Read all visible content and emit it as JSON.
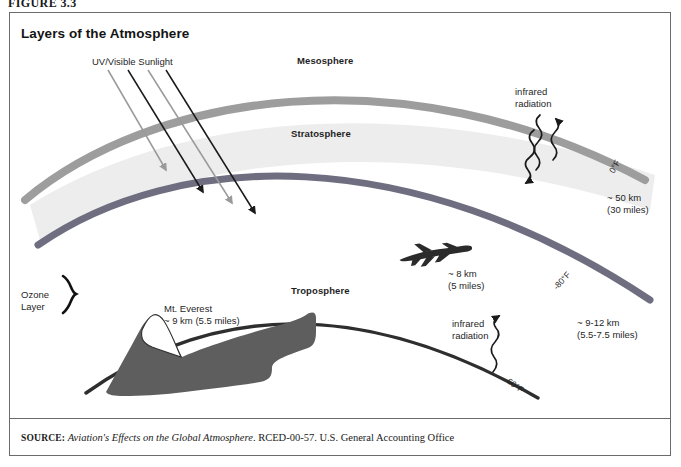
{
  "figure": {
    "number_label": "FIGURE 3.3",
    "title": "Layers of the Atmosphere",
    "frame_border_color": "#6b6b6b",
    "background_color": "#ffffff"
  },
  "source": {
    "label": "SOURCE:",
    "italic_part": "Aviation's Effects on the Global Atmosphere",
    "rest": ". RCED-00-57. U.S. General Accounting Office"
  },
  "layers": [
    {
      "name": "Mesosphere",
      "label_x": 297,
      "label_y": 55,
      "band_color": "#9a9a9a"
    },
    {
      "name": "Stratosphere",
      "label_x": 291,
      "label_y": 128,
      "band_color": "#7a7a8a"
    },
    {
      "name": "Troposphere",
      "label_x": 291,
      "label_y": 285,
      "band_color": "#2b2b2b"
    }
  ],
  "annotations": {
    "sunlight": {
      "label": "UV/Visible Sunlight",
      "label_x": 92,
      "label_y": 56,
      "ray_colors": [
        "#9a9a9a",
        "#1a1a1a",
        "#9a9a9a",
        "#1a1a1a"
      ]
    },
    "ozone": {
      "line1": "Ozone",
      "line2": "Layer",
      "label_x": 21,
      "label_y": 289
    },
    "everest": {
      "line1": "Mt. Everest",
      "line2": "~ 9 km (5.5 miles)",
      "label_x": 164,
      "label_y": 303
    },
    "aircraft": {
      "line1": "~ 8 km",
      "line2": "(5 miles)",
      "label_x": 448,
      "label_y": 268,
      "icon": "airplane-icon"
    },
    "infrared_upper": {
      "line1": "infrared",
      "line2": "radiation",
      "label_x": 515,
      "label_y": 86
    },
    "infrared_lower": {
      "line1": "infrared",
      "line2": "radiation",
      "label_x": 452,
      "label_y": 318
    },
    "altitude_mesopause": {
      "line1": "~ 50 km",
      "line2": "(30 miles)",
      "label_x": 607,
      "label_y": 192
    },
    "altitude_tropopause": {
      "line1": "~ 9-12 km",
      "line2": "(5.5-7.5 miles)",
      "label_x": 577,
      "label_y": 317
    }
  },
  "temperatures": [
    {
      "value": "0°F",
      "x": 607,
      "y": 170,
      "rotation": -62
    },
    {
      "value": "-80°F",
      "x": 551,
      "y": 285,
      "rotation": -48
    },
    {
      "value": "60°F",
      "x": 511,
      "y": 376,
      "rotation": 36
    }
  ],
  "colors": {
    "mesosphere_band": "#9d9d9d",
    "stratosphere_band": "#6e6e80",
    "troposphere_line": "#2e2e2e",
    "stratosphere_fill": "#ededed",
    "ground_fill": "#5e5e5e",
    "ray_gray": "#9a9a9a",
    "ray_black": "#1a1a1a",
    "text": "#1f1f1f"
  }
}
